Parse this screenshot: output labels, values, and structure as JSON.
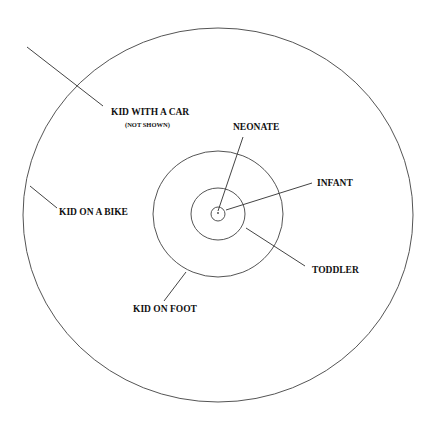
{
  "diagram": {
    "type": "concentric-circles",
    "center": {
      "x": 218,
      "y": 214
    },
    "rings": [
      {
        "name": "neonate",
        "rx": 7,
        "ry": 7
      },
      {
        "name": "infant",
        "rx": 27,
        "ry": 26
      },
      {
        "name": "toddler",
        "rx": 65,
        "ry": 63
      },
      {
        "name": "kid-on-bike",
        "rx": 195,
        "ry": 187
      }
    ],
    "labels": {
      "kid_with_car": "KID WITH A CAR",
      "kid_with_car_note": "(NOT SHOWN)",
      "kid_on_bike": "KID ON A BIKE",
      "kid_on_foot": "KID ON FOOT",
      "neonate": "NEONATE",
      "infant": "INFANT",
      "toddler": "TODDLER"
    },
    "colors": {
      "stroke": "#555555",
      "text": "#111111",
      "background": "#ffffff"
    }
  }
}
